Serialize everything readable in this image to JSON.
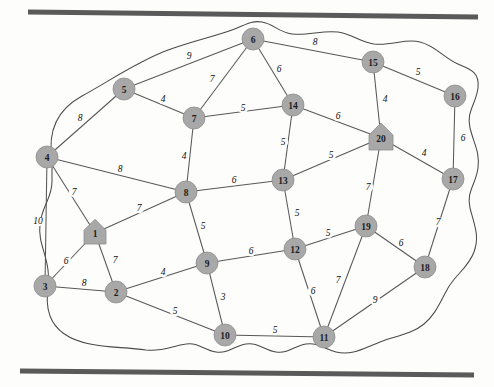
{
  "figure": {
    "type": "weighted-undirected-graph",
    "background_color": "#fdfdfc",
    "node_fill_color": "#a8a8a8",
    "node_stroke_color": "#8e8e8e",
    "edge_color": "#58585a",
    "boundary_color": "#4a4a4a",
    "rule_color": "#5a5a5a"
  },
  "rules": [
    {
      "name": "top-rule",
      "x1": 28,
      "y1": 12,
      "x2": 478,
      "y2": 17
    },
    {
      "name": "bottom-rule",
      "x1": 20,
      "y1": 371,
      "x2": 474,
      "y2": 375
    }
  ],
  "boundary_path": "M 52,160 C 47,128 60,108 82,96 C 108,82 136,62 168,50 C 196,40 216,36 232,30 C 244,26 250,20 262,22 C 274,24 278,32 292,34 C 308,36 322,30 338,32 C 352,34 360,42 374,44 C 392,46 406,38 420,42 C 436,46 444,58 458,64 C 470,69 480,72 478,88 C 476,104 466,112 470,128 C 474,144 480,152 478,168 C 476,184 466,192 470,208 C 474,224 480,236 474,252 C 468,268 456,274 448,288 C 440,302 436,314 424,324 C 412,334 396,336 380,342 C 364,348 352,356 336,352 C 324,349 318,342 306,344 C 294,346 288,354 276,352 C 264,350 258,342 246,344 C 234,346 228,354 216,352 C 204,350 198,342 186,344 C 172,346 162,352 146,350 C 126,347 108,348 90,344 C 70,340 56,332 50,316 C 44,300 50,286 48,270 C 46,252 38,242 40,224 C 42,206 52,198 52,182 Z",
  "nodes": [
    {
      "id": "1",
      "label": "1",
      "x": 95,
      "y": 233,
      "shape": "house",
      "r": 11
    },
    {
      "id": "2",
      "label": "2",
      "x": 116,
      "y": 292,
      "shape": "circle",
      "r": 11
    },
    {
      "id": "3",
      "label": "3",
      "x": 45,
      "y": 286,
      "shape": "circle",
      "r": 11
    },
    {
      "id": "4",
      "label": "4",
      "x": 47,
      "y": 157,
      "shape": "circle",
      "r": 11
    },
    {
      "id": "5",
      "label": "5",
      "x": 124,
      "y": 89,
      "shape": "circle",
      "r": 11
    },
    {
      "id": "6",
      "label": "6",
      "x": 253,
      "y": 39,
      "shape": "circle",
      "r": 11
    },
    {
      "id": "7",
      "label": "7",
      "x": 194,
      "y": 118,
      "shape": "circle",
      "r": 11
    },
    {
      "id": "8",
      "label": "8",
      "x": 186,
      "y": 192,
      "shape": "circle",
      "r": 11
    },
    {
      "id": "9",
      "label": "9",
      "x": 207,
      "y": 263,
      "shape": "circle",
      "r": 11
    },
    {
      "id": "10",
      "label": "10",
      "x": 225,
      "y": 335,
      "shape": "circle",
      "r": 11
    },
    {
      "id": "11",
      "label": "11",
      "x": 324,
      "y": 337,
      "shape": "circle",
      "r": 11
    },
    {
      "id": "12",
      "label": "12",
      "x": 295,
      "y": 249,
      "shape": "circle",
      "r": 11
    },
    {
      "id": "13",
      "label": "13",
      "x": 283,
      "y": 180,
      "shape": "circle",
      "r": 11
    },
    {
      "id": "14",
      "label": "14",
      "x": 293,
      "y": 105,
      "shape": "circle",
      "r": 11
    },
    {
      "id": "15",
      "label": "15",
      "x": 373,
      "y": 62,
      "shape": "circle",
      "r": 11
    },
    {
      "id": "16",
      "label": "16",
      "x": 455,
      "y": 96,
      "shape": "circle",
      "r": 11
    },
    {
      "id": "17",
      "label": "17",
      "x": 453,
      "y": 179,
      "shape": "circle",
      "r": 11
    },
    {
      "id": "18",
      "label": "18",
      "x": 425,
      "y": 267,
      "shape": "circle",
      "r": 11
    },
    {
      "id": "19",
      "label": "19",
      "x": 366,
      "y": 226,
      "shape": "circle",
      "r": 11
    },
    {
      "id": "20",
      "label": "20",
      "x": 381,
      "y": 138,
      "shape": "house",
      "r": 12
    }
  ],
  "edges": [
    {
      "from": "5",
      "to": "6",
      "weight": "9",
      "lx": 189,
      "ly": 56
    },
    {
      "from": "6",
      "to": "15",
      "weight": "8",
      "lx": 315,
      "ly": 42
    },
    {
      "from": "6",
      "to": "7",
      "weight": "7",
      "lx": 212,
      "ly": 79
    },
    {
      "from": "6",
      "to": "14",
      "weight": "6",
      "lx": 279,
      "ly": 69
    },
    {
      "from": "5",
      "to": "7",
      "weight": "4",
      "lx": 163,
      "ly": 99
    },
    {
      "from": "4",
      "to": "5",
      "weight": "8",
      "lx": 80,
      "ly": 118
    },
    {
      "from": "7",
      "to": "14",
      "weight": "5",
      "lx": 243,
      "ly": 108
    },
    {
      "from": "15",
      "to": "16",
      "weight": "5",
      "lx": 418,
      "ly": 72
    },
    {
      "from": "14",
      "to": "20",
      "weight": "6",
      "lx": 338,
      "ly": 116
    },
    {
      "from": "15",
      "to": "20",
      "weight": "4",
      "lx": 385,
      "ly": 99
    },
    {
      "from": "16",
      "to": "17",
      "weight": "6",
      "lx": 463,
      "ly": 138
    },
    {
      "from": "17",
      "to": "20",
      "weight": "4",
      "lx": 424,
      "ly": 153
    },
    {
      "from": "7",
      "to": "8",
      "weight": "4",
      "lx": 184,
      "ly": 156
    },
    {
      "from": "14",
      "to": "13",
      "weight": "5",
      "lx": 283,
      "ly": 142
    },
    {
      "from": "13",
      "to": "20",
      "weight": "5",
      "lx": 331,
      "ly": 155
    },
    {
      "from": "4",
      "to": "8",
      "weight": "8",
      "lx": 120,
      "ly": 169
    },
    {
      "from": "8",
      "to": "13",
      "weight": "6",
      "lx": 234,
      "ly": 180
    },
    {
      "from": "4",
      "to": "1",
      "weight": "7",
      "lx": 74,
      "ly": 192
    },
    {
      "from": "4",
      "to": "3",
      "weight": "10",
      "lx": 38,
      "ly": 221
    },
    {
      "from": "1",
      "to": "8",
      "weight": "7",
      "lx": 139,
      "ly": 208
    },
    {
      "from": "19",
      "to": "20",
      "weight": "7",
      "lx": 368,
      "ly": 187
    },
    {
      "from": "13",
      "to": "12",
      "weight": "5",
      "lx": 297,
      "ly": 213
    },
    {
      "from": "8",
      "to": "9",
      "weight": "5",
      "lx": 203,
      "ly": 226
    },
    {
      "from": "12",
      "to": "19",
      "weight": "5",
      "lx": 328,
      "ly": 233
    },
    {
      "from": "17",
      "to": "18",
      "weight": "7",
      "lx": 438,
      "ly": 222
    },
    {
      "from": "19",
      "to": "18",
      "weight": "6",
      "lx": 401,
      "ly": 243
    },
    {
      "from": "9",
      "to": "12",
      "weight": "6",
      "lx": 251,
      "ly": 251
    },
    {
      "from": "1",
      "to": "3",
      "weight": "6",
      "lx": 66,
      "ly": 261
    },
    {
      "from": "1",
      "to": "2",
      "weight": "7",
      "lx": 115,
      "ly": 260
    },
    {
      "from": "2",
      "to": "9",
      "weight": "4",
      "lx": 163,
      "ly": 272
    },
    {
      "from": "3",
      "to": "2",
      "weight": "8",
      "lx": 84,
      "ly": 283
    },
    {
      "from": "9",
      "to": "10",
      "weight": "3",
      "lx": 223,
      "ly": 297
    },
    {
      "from": "12",
      "to": "11",
      "weight": "6",
      "lx": 313,
      "ly": 291
    },
    {
      "from": "11",
      "to": "19",
      "weight": "7",
      "lx": 338,
      "ly": 280
    },
    {
      "from": "11",
      "to": "18",
      "weight": "9",
      "lx": 375,
      "ly": 300
    },
    {
      "from": "2",
      "to": "10",
      "weight": "5",
      "lx": 175,
      "ly": 311
    },
    {
      "from": "10",
      "to": "11",
      "weight": "5",
      "lx": 275,
      "ly": 330
    }
  ]
}
